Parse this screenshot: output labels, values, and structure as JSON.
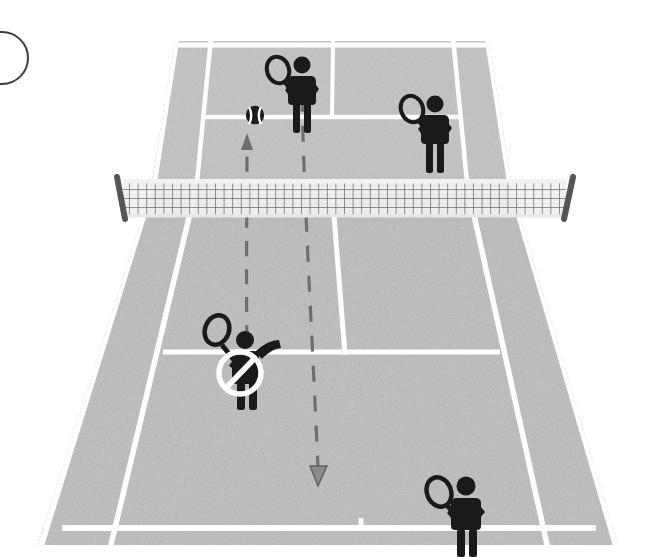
{
  "scene": {
    "title": "Tennis court doubles serve diagram",
    "sport": "tennis",
    "view": "perspective from behind near baseline",
    "canvas": {
      "width": 660,
      "height": 557
    },
    "colors": {
      "background": "#ffffff",
      "court_surface": "#b9b9b9",
      "court_surface_far": "#c4c4c4",
      "court_line": "#ffffff",
      "figure": "#1a1a1a",
      "net_mesh": "#6f6f6f",
      "net_post": "#4a4a4a",
      "trajectory": "#6b6b6b",
      "prohibition_ring": "#ffffff",
      "marker_outline": "#3d3d3d"
    }
  },
  "marker": {
    "name": "step-number-circle",
    "label": "",
    "cropped": true,
    "center_x": 2,
    "center_y": 58,
    "radius": 26
  },
  "court": {
    "name": "tennis-court",
    "surface_label": "",
    "lines": [
      {
        "id": "far-baseline",
        "label": "Far baseline",
        "type": "horizontal",
        "cropped_top": true
      },
      {
        "id": "far-service-line",
        "label": "Far service line",
        "type": "horizontal"
      },
      {
        "id": "near-service-line",
        "label": "Near service line",
        "type": "horizontal"
      },
      {
        "id": "near-baseline",
        "label": "Near baseline",
        "type": "horizontal"
      },
      {
        "id": "left-doubles-sideline",
        "label": "Left doubles sideline",
        "type": "receding"
      },
      {
        "id": "left-singles-sideline",
        "label": "Left singles sideline",
        "type": "receding"
      },
      {
        "id": "right-singles-sideline",
        "label": "Right singles sideline",
        "type": "receding"
      },
      {
        "id": "right-doubles-sideline",
        "label": "Right doubles sideline",
        "type": "receding"
      },
      {
        "id": "center-service-line",
        "label": "Center service line",
        "type": "receding"
      }
    ]
  },
  "net": {
    "name": "tennis-net",
    "label": "Net",
    "mesh_columns": 58,
    "mesh_rows": 5,
    "left_post_label": "Left net post",
    "right_post_label": "Right net post"
  },
  "players": [
    {
      "id": "server",
      "label": "Server",
      "role": "serving player",
      "court_side": "near",
      "position": "near court, left service box, behind service line",
      "pose": "serving, racket raised overhead, tossing arm up",
      "flagged": true,
      "flag_label": "Incorrect position",
      "x": 243,
      "y": 364
    },
    {
      "id": "server-partner",
      "label": "Server's partner",
      "role": "partner of server",
      "court_side": "near",
      "position": "near court, right side at baseline",
      "pose": "standing ready, racket in right hand",
      "flagged": false,
      "x": 463,
      "y": 510
    },
    {
      "id": "receiver",
      "label": "Receiver",
      "role": "receiving player",
      "court_side": "far",
      "position": "far court, left service box at service line",
      "pose": "standing ready, racket in left hand",
      "flagged": false,
      "x": 299,
      "y": 93
    },
    {
      "id": "receiver-partner",
      "label": "Receiver's partner",
      "role": "partner of receiver",
      "court_side": "far",
      "position": "far court, right service box",
      "pose": "standing ready, racket in left hand",
      "flagged": false,
      "x": 431,
      "y": 128
    }
  ],
  "ball": {
    "name": "tennis-ball",
    "label": "Ball",
    "x": 255,
    "y": 115,
    "radius": 9
  },
  "trajectories": [
    {
      "id": "toss-path",
      "label": "Ball toss / bounce path",
      "style": "dashed",
      "arrow": "up",
      "arrow_label": "Direction of ball",
      "from": {
        "x": 247,
        "y": 340
      },
      "to": {
        "x": 247,
        "y": 138
      }
    },
    {
      "id": "serve-path",
      "label": "Serve direction path",
      "style": "dashed",
      "arrow": "down",
      "arrow_label": "Direction of serve",
      "from": {
        "x": 302,
        "y": 96
      },
      "to": {
        "x": 318,
        "y": 482
      }
    }
  ],
  "prohibition": {
    "name": "no-entry-sign",
    "label": "Not allowed",
    "x": 240,
    "y": 373,
    "radius": 22
  }
}
